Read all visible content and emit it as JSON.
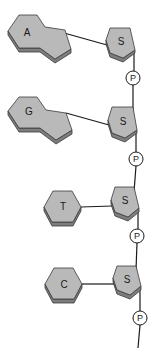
{
  "diagram": {
    "colors": {
      "base_fill": "#b9b9b9",
      "base_shadow": "#7d7d7d",
      "outline": "#3a3a3a",
      "line": "#1a1a1a",
      "phosphate_fill": "#ffffff"
    },
    "nucleotides": [
      {
        "base": "A",
        "base_type": "purine",
        "sugar": "S",
        "phosphate": "P"
      },
      {
        "base": "G",
        "base_type": "purine",
        "sugar": "S",
        "phosphate": "P"
      },
      {
        "base": "T",
        "base_type": "pyrimidine",
        "sugar": "S",
        "phosphate": "P"
      },
      {
        "base": "C",
        "base_type": "pyrimidine",
        "sugar": "S",
        "phosphate": "P"
      }
    ]
  }
}
